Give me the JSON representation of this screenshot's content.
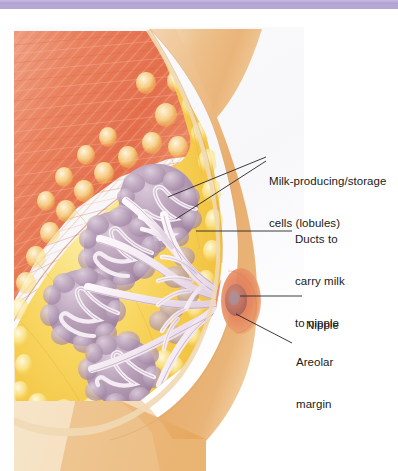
{
  "figure": {
    "type": "anatomical-illustration",
    "top_bar_color": "#b5a6d4",
    "background_color": "#ffffff"
  },
  "labels": [
    {
      "id": "lobules",
      "name": "lobules-label",
      "line1": "Milk-producing/storage",
      "line2": "cells (lobules)",
      "leader_lines": 2
    },
    {
      "id": "ducts",
      "name": "ducts-label",
      "line1": "Ducts to",
      "line2": "carry milk",
      "line3": "to nipple",
      "leader_lines": 1
    },
    {
      "id": "nipple",
      "name": "nipple-label",
      "line1": "Nipple",
      "leader_lines": 1
    },
    {
      "id": "areolar",
      "name": "areolar-margin-label",
      "line1": "Areolar",
      "line2": "margin",
      "leader_lines": 1
    }
  ],
  "structures": {
    "chest_muscle": {
      "label": "chest muscle",
      "color": "#e8795a"
    },
    "fatty_tissue": {
      "label": "fatty tissue",
      "color": "#f6cf5c"
    },
    "lobules": {
      "label": "lobules",
      "color": "#b29bb4"
    },
    "ducts": {
      "label": "ducts",
      "color": "#f2eaf0"
    },
    "skin": {
      "label": "skin",
      "color": "#eeb47d"
    },
    "areola": {
      "label": "areola",
      "color": "#e98b5c"
    },
    "nipple": {
      "label": "nipple",
      "color": "#c97a6d"
    }
  },
  "text_color": "#1a1a1a",
  "leader_line_color": "#262626"
}
